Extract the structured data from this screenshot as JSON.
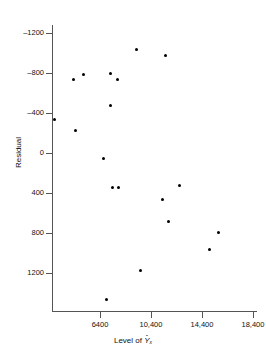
{
  "figure": {
    "type": "scatter",
    "background": "#ffffff",
    "marker_color": "#000000",
    "axis_color": "#555555"
  },
  "axes": {
    "x_title_prefix": "Level of ",
    "x_title_var": "Y",
    "x_title_hat": "ˆ",
    "x_title_sub": "x",
    "y_title": "Residual",
    "x_ticks": [
      "6400",
      "10,400",
      "14,400",
      "18,400"
    ],
    "y_ticks": [
      "–1200",
      "–800",
      "–400",
      "0",
      "400",
      "800",
      "1200"
    ]
  },
  "chart_data": {
    "type": "scatter",
    "title": "",
    "xlabel": "Level of Ŷx",
    "ylabel": "Residual",
    "xlim": [
      2400,
      19600
    ],
    "ylim": [
      -1420,
      1580
    ],
    "y_axis_inverted": true,
    "grid": false,
    "legend": null,
    "x_tick_values": [
      6400,
      10400,
      14400,
      18400
    ],
    "x_tick_labels": [
      "6400",
      "10,400",
      "14,400",
      "18,400"
    ],
    "y_tick_values": [
      -1200,
      -800,
      -400,
      0,
      400,
      800,
      1200
    ],
    "y_tick_labels": [
      "–1200",
      "–800",
      "–400",
      "0",
      "400",
      "800",
      "1200"
    ],
    "points": [
      {
        "x": 2870,
        "y": -340
      },
      {
        "x": 4360,
        "y": -740
      },
      {
        "x": 4440,
        "y": -230
      },
      {
        "x": 5140,
        "y": -790
      },
      {
        "x": 6670,
        "y": 50
      },
      {
        "x": 6900,
        "y": 1460
      },
      {
        "x": 7250,
        "y": -800
      },
      {
        "x": 7250,
        "y": -480
      },
      {
        "x": 7380,
        "y": 340
      },
      {
        "x": 7800,
        "y": -740
      },
      {
        "x": 7850,
        "y": 340
      },
      {
        "x": 9270,
        "y": -1040
      },
      {
        "x": 9560,
        "y": 1170
      },
      {
        "x": 11320,
        "y": 460
      },
      {
        "x": 11550,
        "y": -980
      },
      {
        "x": 11800,
        "y": 680
      },
      {
        "x": 12650,
        "y": 320
      },
      {
        "x": 15010,
        "y": 960
      },
      {
        "x": 15700,
        "y": 790
      }
    ]
  }
}
